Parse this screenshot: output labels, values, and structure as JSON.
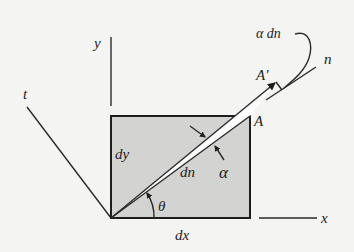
{
  "figure": {
    "background": "#f4f4f2",
    "element_fill": "#d3d3d1",
    "line_color": "#2a2a2a",
    "labels": {
      "y_axis": "y",
      "x_axis": "x",
      "t_axis": "t",
      "n_axis": "n",
      "dy": "dy",
      "dx": "dx",
      "dn": "dn",
      "alpha": "α",
      "theta": "θ",
      "point_a": "A",
      "point_a_prime": "A′",
      "alpha_dn": "α dn"
    }
  }
}
